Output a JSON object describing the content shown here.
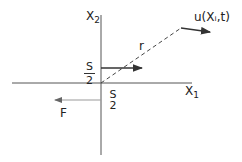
{
  "diagram": {
    "axes": {
      "x_label_base": "X",
      "x_label_sub": "1",
      "y_label_base": "X",
      "y_label_sub": "2"
    },
    "radius_label": "r",
    "field_label": "u(Xᵢ,t)",
    "upper_surface": {
      "num": "S",
      "den": "2"
    },
    "lower_surface": {
      "num": "S",
      "den": "2"
    },
    "force_label": "F",
    "colors": {
      "line": "#333333",
      "force": "#888888"
    }
  }
}
